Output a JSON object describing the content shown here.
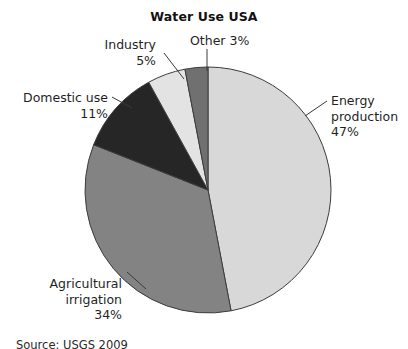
{
  "chart": {
    "title": "Water Use USA",
    "source": "Source: USGS 2009"
  },
  "labels": {
    "energy": "Energy\nproduction\n47%",
    "other": "Other 3%",
    "industry": "Industry\n5%",
    "domestic": "Domestic use\n11%",
    "agricultural": "Agricultural\nirrigation\n34%"
  },
  "chart_data": {
    "type": "pie",
    "title": "Water Use USA",
    "xlabel": "",
    "ylabel": "",
    "legend": "none",
    "grid": false,
    "start_angle_deg": 0,
    "direction": "clockwise",
    "center_px": [
      208,
      190
    ],
    "radius_px": 123,
    "categories": [
      "Energy production",
      "Agricultural irrigation",
      "Domestic use",
      "Industry",
      "Other"
    ],
    "values": [
      47,
      34,
      11,
      5,
      3
    ],
    "unit": "%",
    "colors": [
      "#d8d8d8",
      "#838383",
      "#262626",
      "#e3e3e3",
      "#707070"
    ],
    "slice_edge_color": "#3c3c3c",
    "annotations": [
      "Energy production 47%",
      "Agricultural irrigation 34%",
      "Domestic use 11%",
      "Industry 5%",
      "Other 3%"
    ],
    "source": "Source: USGS 2009"
  }
}
